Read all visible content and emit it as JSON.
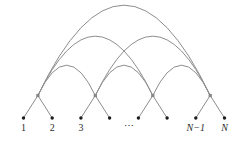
{
  "figure": {
    "name": "arc-network-diagram",
    "canvas": {
      "width": 243,
      "height": 144,
      "background": "#ffffff"
    },
    "style": {
      "line_color": "#8d8d8d",
      "line_width": 1,
      "leaf_dot_color": "#1c1c1c",
      "leaf_dot_radius": 1.7,
      "hub_dot_color": "#858585",
      "hub_dot_size": 3.2,
      "label_color": "#2b2b2b",
      "label_font_size": 10
    },
    "leaf_y": 118,
    "hub_y": 95.5,
    "label_baseline_y": 131,
    "leaves": [
      {
        "x": 23.5,
        "label": "1",
        "italic": false
      },
      {
        "x": 52.2,
        "label": "2",
        "italic": false
      },
      {
        "x": 80.9,
        "label": "3",
        "italic": false
      },
      {
        "x": 109.6,
        "label": "",
        "italic": false
      },
      {
        "x": 138.4,
        "label": "",
        "italic": false
      },
      {
        "x": 167.1,
        "label": "",
        "italic": false
      },
      {
        "x": 195.8,
        "label": "N−1",
        "italic": true
      },
      {
        "x": 224.5,
        "label": "N",
        "italic": true
      }
    ],
    "ellipsis": {
      "text": "⋯",
      "x": 129,
      "y": 129
    },
    "hubs": [
      {
        "x": 37.9,
        "children": [
          0,
          1
        ]
      },
      {
        "x": 95.3,
        "children": [
          2,
          3
        ]
      },
      {
        "x": 152.8,
        "children": [
          4,
          5
        ]
      },
      {
        "x": 210.2,
        "children": [
          6,
          7
        ]
      }
    ],
    "arcs": [
      {
        "from": 0,
        "to": 1,
        "apex_y": 65
      },
      {
        "from": 1,
        "to": 2,
        "apex_y": 65
      },
      {
        "from": 2,
        "to": 3,
        "apex_y": 65
      },
      {
        "from": 0,
        "to": 2,
        "apex_y": 36
      },
      {
        "from": 1,
        "to": 3,
        "apex_y": 36
      },
      {
        "from": 0,
        "to": 3,
        "apex_y": 5
      }
    ]
  }
}
